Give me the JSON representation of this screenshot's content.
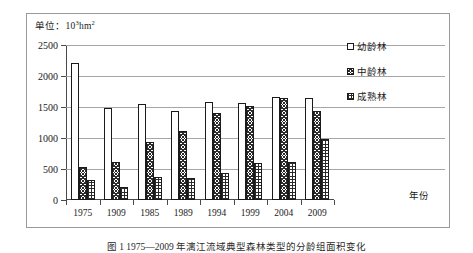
{
  "unit": {
    "prefix": "单位：10",
    "exponent": "3",
    "suffix": "hm",
    "suffix_exponent": "2",
    "full": "单位：10³hm²"
  },
  "axis": {
    "x_title": "年份",
    "y_ticks": [
      "2500",
      "2000",
      "1500",
      "1000",
      "500",
      "0"
    ]
  },
  "legend": {
    "items": [
      {
        "label": "幼龄林",
        "pattern": "empty"
      },
      {
        "label": "中龄林",
        "pattern": "cross-hatch"
      },
      {
        "label": "成熟林",
        "pattern": "stipple"
      }
    ]
  },
  "caption": "图 1  1975—2009 年漓江流域典型森林类型的分龄组面积变化",
  "chart_data": {
    "type": "bar",
    "title": "",
    "xlabel": "年份",
    "ylabel": "",
    "unit": "10³hm²",
    "ylim": [
      0,
      2500
    ],
    "ytick_step": 500,
    "grid": true,
    "legend_position": "right",
    "categories": [
      "1975",
      "1909",
      "1985",
      "1989",
      "1994",
      "1999",
      "2004",
      "2009"
    ],
    "series": [
      {
        "name": "幼龄林",
        "values": [
          2210,
          1480,
          1550,
          1440,
          1575,
          1565,
          1665,
          1650
        ]
      },
      {
        "name": "中龄林",
        "values": [
          530,
          610,
          930,
          1120,
          1400,
          1520,
          1640,
          1440
        ]
      },
      {
        "name": "成熟林",
        "values": [
          330,
          210,
          370,
          360,
          440,
          590,
          620,
          990
        ]
      }
    ]
  }
}
